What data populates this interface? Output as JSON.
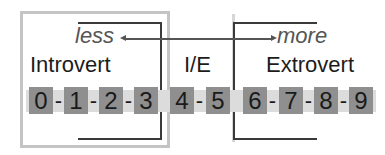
{
  "diagram": {
    "arrow": {
      "left_label": "less",
      "right_label": "more"
    },
    "categories": [
      {
        "label": "Introvert",
        "range": [
          0,
          3
        ]
      },
      {
        "label": "I/E",
        "range": [
          4,
          5
        ]
      },
      {
        "label": "Extrovert",
        "range": [
          6,
          9
        ]
      }
    ],
    "scale": {
      "digits": [
        "0",
        "1",
        "2",
        "3",
        "4",
        "5",
        "6",
        "7",
        "8",
        "9"
      ],
      "separator": "-"
    },
    "colors": {
      "digit_box": "#8f8f8f",
      "band": "#dcdcdc",
      "outer_box": "#c4c4c4",
      "bracket": "#3a3a3a",
      "arrow": "#555555"
    }
  }
}
